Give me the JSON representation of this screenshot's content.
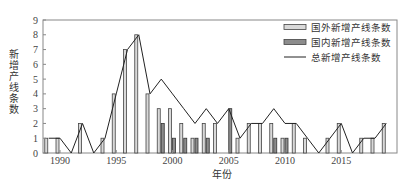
{
  "chart_data": {
    "type": "bar",
    "title": "",
    "xlabel": "年份",
    "ylabel": "新增产线条数",
    "ylim": [
      0,
      9
    ],
    "yticks": [
      0,
      1,
      2,
      3,
      4,
      5,
      6,
      7,
      8,
      9
    ],
    "xticks": [
      1990,
      1995,
      2000,
      2005,
      2010,
      2015
    ],
    "grid": false,
    "legend_position": "upper right",
    "categories": [
      1989,
      1990,
      1991,
      1992,
      1993,
      1994,
      1995,
      1996,
      1997,
      1998,
      1999,
      2000,
      2001,
      2002,
      2003,
      2004,
      2005,
      2006,
      2007,
      2008,
      2009,
      2010,
      2011,
      2012,
      2013,
      2014,
      2015,
      2016,
      2017,
      2018,
      2019
    ],
    "series": [
      {
        "name": "国外新增产线条数",
        "type": "bar",
        "color": "#d9d9d9",
        "values": [
          1,
          1,
          0,
          2,
          0,
          1,
          4,
          7,
          8,
          4,
          3,
          3,
          2,
          1,
          2,
          2,
          0,
          1,
          2,
          2,
          2,
          1,
          2,
          1,
          0,
          1,
          2,
          0,
          1,
          1,
          2
        ]
      },
      {
        "name": "国内新增产线条数",
        "type": "bar",
        "color": "#8c8c8c",
        "values": [
          0,
          0,
          0,
          0,
          0,
          0,
          0,
          0,
          0,
          0,
          2,
          1,
          1,
          1,
          1,
          0,
          3,
          0,
          0,
          0,
          1,
          1,
          0,
          0,
          0,
          0,
          0,
          0,
          0,
          0,
          0
        ]
      },
      {
        "name": "总新增产线条数",
        "type": "line",
        "color": "#222222",
        "values": [
          1,
          1,
          0,
          2,
          0,
          1,
          4,
          7,
          8,
          4,
          5,
          4,
          3,
          2,
          3,
          2,
          3,
          1,
          2,
          2,
          3,
          2,
          2,
          1,
          0,
          1,
          2,
          0,
          1,
          1,
          2
        ]
      }
    ]
  },
  "axis": {
    "y_label": "新增产线条数",
    "x_label": "年份"
  },
  "legend": {
    "items": [
      {
        "label": "国外新增产线条数",
        "kind": "bar-light"
      },
      {
        "label": "国内新增产线条数",
        "kind": "bar-dark"
      },
      {
        "label": "总新增产线条数",
        "kind": "line"
      }
    ]
  }
}
